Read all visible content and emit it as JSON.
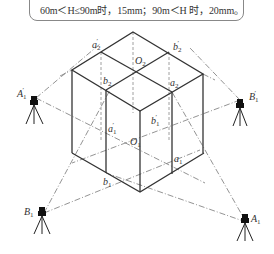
{
  "note": {
    "text": "60m＜H≤90m时，15mm；90m＜H 时，20mm。"
  },
  "diagram": {
    "type": "axonometric building with theodolite stations",
    "colors": {
      "line": "#333333",
      "dash": "#777777",
      "background": "#ffffff"
    },
    "labels": {
      "a2_prime": "a",
      "a2_prime_sub": "2",
      "a2_prime_mark": "′",
      "b2_prime": "b",
      "b2_prime_sub": "2",
      "b2_prime_mark": "′",
      "O2": "O",
      "O2_sub": "2",
      "b2": "b",
      "b2_sub": "2",
      "a2": "a",
      "a2_sub": "2",
      "a1_prime": "a",
      "a1_prime_sub": "1",
      "a1_prime_mark": "′",
      "b1_prime": "b",
      "b1_prime_sub": "1",
      "b1_prime_mark": "′",
      "O1": "O",
      "O1_sub": "1",
      "a1": "a",
      "a1_sub": "1",
      "b1": "b",
      "b1_sub": "1",
      "A1_prime": "A",
      "A1_prime_sub": "1",
      "A1_prime_mark": "′",
      "B1_prime": "B",
      "B1_prime_sub": "1",
      "B1_prime_mark": "′",
      "B1": "B",
      "B1_sub": "1",
      "A1": "A",
      "A1_sub": "1"
    },
    "stations": [
      "A1′",
      "B1′",
      "B1",
      "A1"
    ]
  }
}
